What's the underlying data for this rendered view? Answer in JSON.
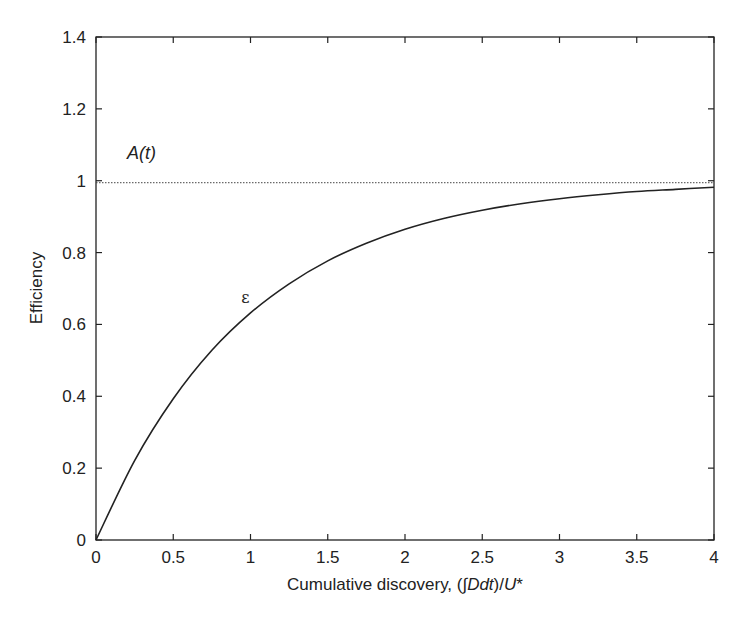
{
  "chart_data": {
    "type": "line",
    "title": "",
    "xlabel": "Cumulative discovery, (∫Ddt)/U*",
    "xlabel_parts": {
      "prefix": "Cumulative discovery, (∫",
      "italic1": "Ddt",
      "mid": ")/",
      "italic2": "U",
      "suffix": "*"
    },
    "ylabel": "Efficiency",
    "xlim": [
      0,
      4
    ],
    "ylim": [
      0,
      1.4
    ],
    "x_ticks": [
      0,
      0.5,
      1,
      1.5,
      2,
      2.5,
      3,
      3.5,
      4
    ],
    "x_tick_labels": [
      "0",
      "0.5",
      "1",
      "1.5",
      "2",
      "2.5",
      "3",
      "3.5",
      "4"
    ],
    "y_ticks": [
      0,
      0.2,
      0.4,
      0.6,
      0.8,
      1,
      1.2,
      1.4
    ],
    "y_tick_labels": [
      "0",
      "0.2",
      "0.4",
      "0.6",
      "0.8",
      "1",
      "1.2",
      "1.4"
    ],
    "grid": false,
    "legend": null,
    "series": [
      {
        "name": "ε",
        "style": "solid",
        "color": "#222222",
        "x": [
          0,
          0.25,
          0.5,
          0.75,
          1,
          1.25,
          1.5,
          1.75,
          2,
          2.25,
          2.5,
          2.75,
          3,
          3.25,
          3.5,
          3.75,
          4
        ],
        "values": [
          0,
          0.221,
          0.393,
          0.528,
          0.632,
          0.713,
          0.777,
          0.826,
          0.865,
          0.895,
          0.918,
          0.936,
          0.95,
          0.961,
          0.97,
          0.976,
          0.982
        ]
      },
      {
        "name": "A(t)",
        "style": "dotted",
        "color": "#444444",
        "x": [
          0,
          4
        ],
        "values": [
          1,
          1
        ]
      }
    ],
    "annotations": [
      {
        "text": "A(t)",
        "x": 0.2,
        "y": 1.06
      },
      {
        "text": "ε",
        "x": 0.94,
        "y": 0.66
      }
    ]
  }
}
